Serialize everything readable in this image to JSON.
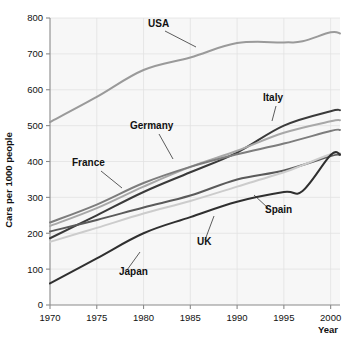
{
  "chart_data": {
    "type": "line",
    "title": "",
    "xlabel": "Year",
    "ylabel": "Cars per 1000 people",
    "xlim": [
      1970,
      2001
    ],
    "ylim": [
      0,
      800
    ],
    "xticks": [
      "1970",
      "1975",
      "1980",
      "1985",
      "1990",
      "1995",
      "2000"
    ],
    "xtick_values": [
      1970,
      1975,
      1980,
      1985,
      1990,
      1995,
      2000
    ],
    "yticks": [
      "0",
      "100",
      "200",
      "300",
      "400",
      "500",
      "600",
      "700",
      "800"
    ],
    "ytick_values": [
      0,
      100,
      200,
      300,
      400,
      500,
      600,
      700,
      800
    ],
    "grid": true,
    "legend": "inline-labels",
    "series": [
      {
        "name": "USA",
        "color": "#9a9a9a",
        "width": 2.0,
        "x": [
          1970,
          1975,
          1980,
          1985,
          1990,
          1995,
          1997,
          2000,
          2001
        ],
        "values": [
          510,
          580,
          655,
          690,
          730,
          732,
          735,
          760,
          757
        ]
      },
      {
        "name": "Italy",
        "color": "#3a3a3a",
        "width": 2.0,
        "x": [
          1970,
          1975,
          1980,
          1985,
          1990,
          1995,
          2000,
          2001
        ],
        "values": [
          186,
          250,
          315,
          370,
          425,
          500,
          540,
          543
        ]
      },
      {
        "name": "Germany",
        "color": "#a8a8a8",
        "width": 2.0,
        "x": [
          1970,
          1975,
          1980,
          1985,
          1990,
          1995,
          2000,
          2001
        ],
        "values": [
          220,
          270,
          330,
          385,
          430,
          480,
          512,
          515
        ]
      },
      {
        "name": "France",
        "color": "#7d7d7d",
        "width": 2.0,
        "x": [
          1970,
          1975,
          1980,
          1985,
          1990,
          1995,
          2000,
          2001
        ],
        "values": [
          230,
          280,
          340,
          385,
          420,
          450,
          485,
          488
        ]
      },
      {
        "name": "UK",
        "color": "#5a5a5a",
        "width": 2.0,
        "x": [
          1970,
          1975,
          1980,
          1985,
          1990,
          1995,
          2000,
          2001
        ],
        "values": [
          205,
          237,
          272,
          305,
          350,
          375,
          415,
          418
        ]
      },
      {
        "name": "Spain",
        "color": "#cccccc",
        "width": 2.0,
        "x": [
          1970,
          1975,
          1980,
          1985,
          1990,
          1995,
          1997,
          2000,
          2001
        ],
        "values": [
          176,
          215,
          255,
          290,
          330,
          370,
          390,
          420,
          423
        ]
      },
      {
        "name": "Japan",
        "color": "#2f2f2f",
        "width": 2.0,
        "x": [
          1970,
          1975,
          1980,
          1985,
          1990,
          1995,
          1997,
          2000,
          2001
        ],
        "values": [
          60,
          130,
          200,
          245,
          288,
          315,
          318,
          418,
          420
        ]
      }
    ],
    "annotations": [
      {
        "text": "USA",
        "x": 148,
        "y": 27,
        "leader": [
          [
            165,
            31
          ],
          [
            196,
            47
          ]
        ]
      },
      {
        "text": "Italy",
        "x": 263,
        "y": 101,
        "leader": [
          [
            276,
            106
          ],
          [
            272,
            121
          ]
        ]
      },
      {
        "text": "Germany",
        "x": 130,
        "y": 129,
        "leader": [
          [
            159,
            134
          ],
          [
            173,
            159
          ]
        ]
      },
      {
        "text": "France",
        "x": 72,
        "y": 166,
        "leader": [
          [
            101,
            171
          ],
          [
            122,
            188
          ]
        ]
      },
      {
        "text": "Spain",
        "x": 265,
        "y": 213,
        "leader": [
          [
            268,
            208
          ],
          [
            254,
            195
          ]
        ]
      },
      {
        "text": "UK",
        "x": 197,
        "y": 245,
        "leader": [
          [
            205,
            240
          ],
          [
            214,
            216
          ]
        ]
      },
      {
        "text": "Japan",
        "x": 119,
        "y": 275,
        "leader": [
          [
            127,
            270
          ],
          [
            140,
            252
          ]
        ]
      }
    ]
  }
}
